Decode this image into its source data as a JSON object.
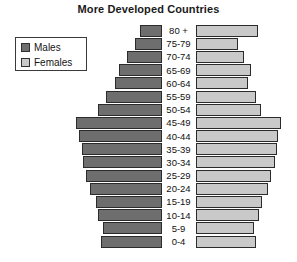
{
  "chart": {
    "title": "More Developed Countries"
  },
  "legend": {
    "position": "top-left",
    "items": [
      {
        "label": "Males",
        "color": "#6e6e6e",
        "icon": "legend-swatch-males"
      },
      {
        "label": "Females",
        "color": "#c9c9c9",
        "icon": "legend-swatch-females"
      }
    ]
  },
  "chart_data": {
    "type": "bar",
    "subtype": "population-pyramid",
    "title": "More Developed Countries",
    "xlabel": "",
    "ylabel": "",
    "grid": false,
    "legend_position": "top-left",
    "orientation": "horizontal",
    "categories": [
      "80 +",
      "75-79",
      "70-74",
      "65-69",
      "60-64",
      "55-59",
      "50-54",
      "45-49",
      "40-44",
      "35-39",
      "30-34",
      "25-29",
      "20-24",
      "15-19",
      "10-14",
      "5-9",
      "0-4"
    ],
    "axis_note": "Bars drawn outward from a central age-label column; values are relative population widths in pixels as rendered.",
    "series": [
      {
        "name": "Males",
        "color": "#6e6e6e",
        "direction": "left",
        "values": [
          22,
          27,
          35,
          43,
          47,
          56,
          64,
          86,
          83,
          80,
          79,
          76,
          72,
          66,
          64,
          59,
          61
        ]
      },
      {
        "name": "Females",
        "color": "#c9c9c9",
        "direction": "right",
        "values": [
          62,
          42,
          48,
          55,
          52,
          60,
          65,
          85,
          82,
          81,
          79,
          75,
          72,
          66,
          63,
          58,
          60
        ]
      }
    ]
  }
}
